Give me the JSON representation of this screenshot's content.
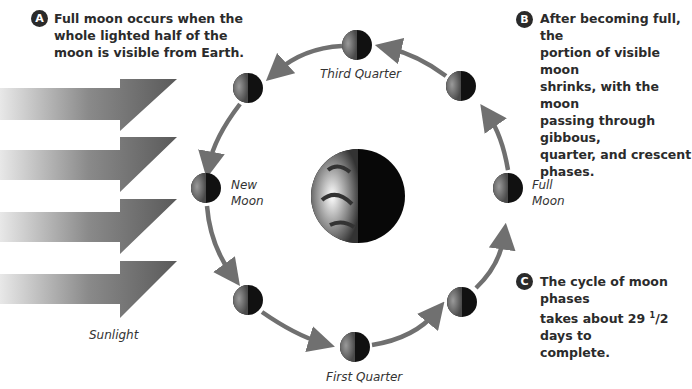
{
  "callouts": {
    "a": {
      "badge": "A",
      "lines": [
        "Full moon occurs when the",
        "whole lighted half of the",
        "moon is visible from Earth."
      ]
    },
    "b": {
      "badge": "B",
      "lines": [
        "After becoming full, the",
        "portion of visible moon",
        "shrinks, with the moon",
        "passing through gibbous,",
        "quarter, and crescent",
        "phases."
      ]
    },
    "c": {
      "badge": "C",
      "line1": "The cycle of moon phases",
      "line2_pre": "takes about 29 ",
      "line2_sup": "1",
      "line2_post": "/2 days to",
      "line3": "complete."
    }
  },
  "labels": {
    "third_quarter": "Third Quarter",
    "new_moon_1": "New",
    "new_moon_2": "Moon",
    "full_moon_1": "Full",
    "full_moon_2": "Moon",
    "first_quarter": "First Quarter",
    "sunlight": "Sunlight"
  },
  "colors": {
    "arrow": "#707070",
    "text": "#2b2b2b",
    "moon_dark": "#111111",
    "moon_light": "#7a7a7a"
  }
}
